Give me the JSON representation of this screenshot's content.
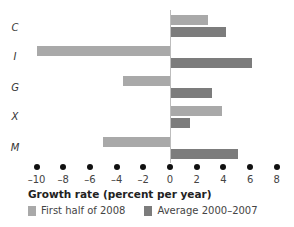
{
  "chart_data": {
    "type": "bar",
    "orientation": "horizontal",
    "title": "",
    "xlabel": "Growth rate (percent per year)",
    "ylabel": "",
    "categories": [
      "C",
      "I",
      "G",
      "X",
      "M"
    ],
    "series": [
      {
        "name": "First half of 2008",
        "color": "#a9a9a9",
        "values": [
          2.8,
          -10.0,
          -3.5,
          3.8,
          -5.0
        ]
      },
      {
        "name": "Average 2000–2007",
        "color": "#7c7c7c",
        "values": [
          4.1,
          6.1,
          3.1,
          1.4,
          5.0
        ]
      }
    ],
    "xlim": [
      -10,
      8
    ],
    "xticks": [
      -10,
      -8,
      -6,
      -4,
      -2,
      0,
      2,
      4,
      6,
      8
    ],
    "xtick_labels": [
      "–10",
      "–8",
      "–6",
      "–4",
      "–2",
      "0",
      "2",
      "4",
      "6",
      "8"
    ],
    "grid": false,
    "legend_position": "bottom"
  },
  "labels": {
    "categories": [
      "C",
      "I",
      "G",
      "X",
      "M"
    ],
    "axis_title": "Growth rate (percent per year)",
    "legend_first": "First half of 2008",
    "legend_avg": "Average 2000–2007",
    "ticks": [
      "–10",
      "–8",
      "–6",
      "–4",
      "–2",
      "0",
      "2",
      "4",
      "6",
      "8"
    ]
  }
}
